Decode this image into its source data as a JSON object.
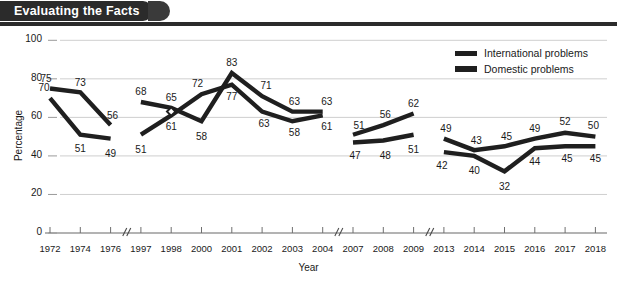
{
  "banner": {
    "title": "Evaluating the Facts"
  },
  "legend": {
    "position": "top-right",
    "items": [
      {
        "label": "International problems",
        "color": "#1f1f1f"
      },
      {
        "label": "Domestic problems",
        "color": "#1f1f1f"
      }
    ]
  },
  "axes": {
    "ylabel": "Percentage",
    "xlabel": "Year",
    "yticks": [
      "0",
      "20",
      "40",
      "60",
      "80",
      "100"
    ],
    "break_marker": "//"
  },
  "chart_data": {
    "type": "line",
    "title": "Evaluating the Facts",
    "xlabel": "Year",
    "ylabel": "Percentage",
    "ylim": [
      0,
      100
    ],
    "yticks": [
      0,
      20,
      40,
      60,
      80,
      100
    ],
    "grid": true,
    "legend_position": "top-right",
    "axis_breaks": [
      {
        "after": "1976",
        "before": "1997"
      },
      {
        "after": "2004",
        "before": "2007"
      },
      {
        "after": "2009",
        "before": "2013"
      }
    ],
    "categories": [
      "1972",
      "1974",
      "1976",
      "1997",
      "1998",
      "2000",
      "2001",
      "2002",
      "2003",
      "2004",
      "2007",
      "2008",
      "2009",
      "2013",
      "2014",
      "2015",
      "2016",
      "2017",
      "2018"
    ],
    "series": [
      {
        "name": "International problems",
        "values": [
          75,
          73,
          56,
          68,
          65,
          58,
          83,
          71,
          63,
          63,
          51,
          56,
          62,
          49,
          43,
          45,
          49,
          52,
          50
        ]
      },
      {
        "name": "Domestic problems",
        "values": [
          70,
          51,
          49,
          51,
          61,
          72,
          77,
          63,
          58,
          61,
          47,
          48,
          51,
          42,
          40,
          32,
          44,
          45,
          45
        ]
      }
    ]
  }
}
